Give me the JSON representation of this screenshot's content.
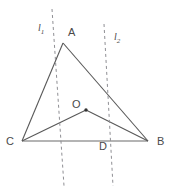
{
  "figure": {
    "kind": "geometry-diagram",
    "width": 177,
    "height": 191,
    "background_color": "#ffffff",
    "solid_stroke_color": "#585858",
    "baseline_stroke_color": "#9b9b9b",
    "dashed_stroke_color": "#8f8f94",
    "label_color": "#4a4a4a",
    "point_color": "#333333"
  },
  "labels": {
    "A": "A",
    "B": "B",
    "C": "C",
    "D": "D",
    "O": "O",
    "line1": "l",
    "line1_sub": "1",
    "line2": "l",
    "line2_sub": "2"
  },
  "points": {
    "A": {
      "x": 63,
      "y": 43
    },
    "B": {
      "x": 148,
      "y": 141
    },
    "C": {
      "x": 22,
      "y": 141
    },
    "D": {
      "x": 93,
      "y": 141
    },
    "O": {
      "x": 86,
      "y": 110
    }
  },
  "label_positions": {
    "A": {
      "x": 68,
      "y": 27
    },
    "B": {
      "x": 157,
      "y": 136
    },
    "C": {
      "x": 6,
      "y": 136
    },
    "D": {
      "x": 99,
      "y": 141
    },
    "O": {
      "x": 72,
      "y": 99
    },
    "line1": {
      "x": 38,
      "y": 23
    },
    "line2": {
      "x": 114,
      "y": 32
    }
  },
  "segments": [
    {
      "name": "segment-AC",
      "from": "A",
      "to": "C",
      "style": "solid"
    },
    {
      "name": "segment-AB",
      "from": "A",
      "to": "B",
      "style": "solid"
    },
    {
      "name": "segment-OC",
      "from": "O",
      "to": "C",
      "style": "solid"
    },
    {
      "name": "segment-OB",
      "from": "O",
      "to": "B",
      "style": "solid"
    },
    {
      "name": "segment-CB-baseline",
      "from": "C",
      "to": "B",
      "style": "baseline"
    }
  ],
  "dashed_lines": [
    {
      "name": "line-l1",
      "label": "l1",
      "x1": 52,
      "y1": 9,
      "x2": 64,
      "y2": 186,
      "dash": "3 3"
    },
    {
      "name": "line-l2",
      "label": "l2",
      "x1": 104,
      "y1": 24,
      "x2": 113,
      "y2": 186,
      "dash": "3 3"
    }
  ]
}
